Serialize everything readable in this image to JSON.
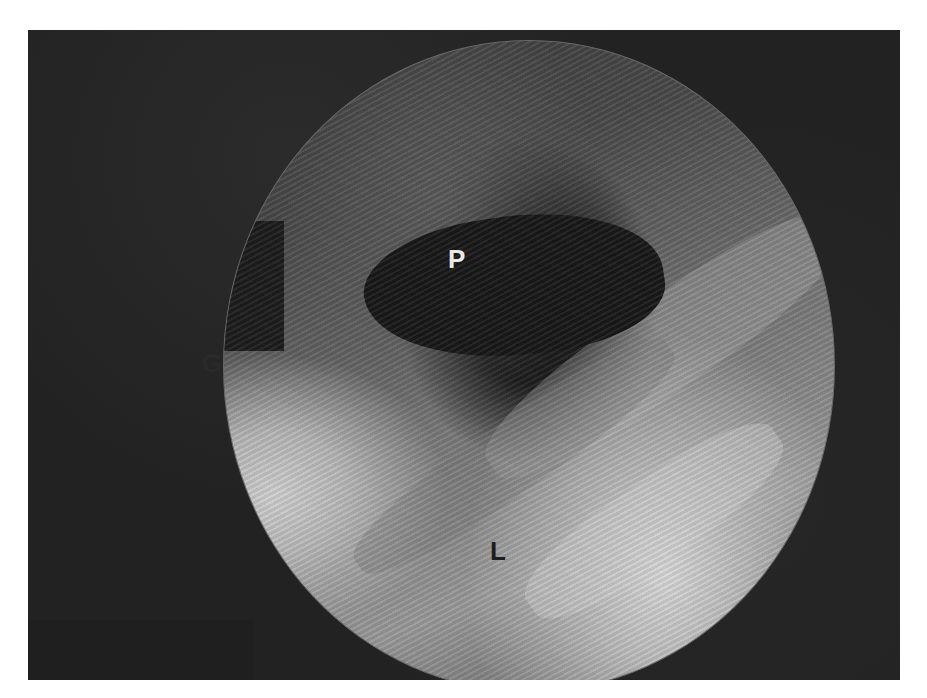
{
  "image": {
    "description": "Grayscale endoscopic view with labeled anatomical structures",
    "labels": {
      "p": "P",
      "g": "G",
      "l": "L"
    },
    "colors": {
      "background": "#1f1f1f",
      "border": "#ffffff",
      "highlight": "#d8d8d8"
    }
  }
}
